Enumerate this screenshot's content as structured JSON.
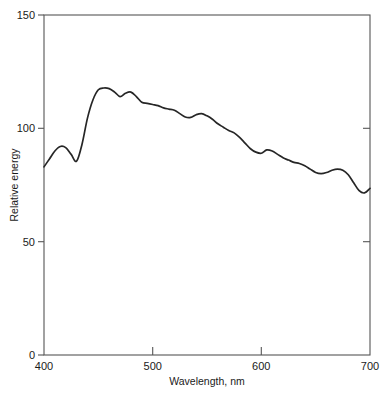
{
  "chart_data": {
    "type": "line",
    "title": "",
    "subtitle": "",
    "xlabel": "Wavelength, nm",
    "ylabel": "Relative energy",
    "xlim": [
      400,
      700
    ],
    "ylim": [
      0,
      150
    ],
    "xticks": [
      400,
      500,
      600,
      700
    ],
    "yticks": [
      0,
      50,
      100,
      150
    ],
    "xtick_labels": [
      "400",
      "500",
      "600",
      "700"
    ],
    "ytick_labels": [
      "0",
      "50",
      "100",
      "150"
    ],
    "grid": false,
    "legend": null,
    "legend_position": "none",
    "annotations": [],
    "series": [
      {
        "name": "Relative spectral power",
        "color": "#262626",
        "x": [
          400,
          405,
          410,
          415,
          420,
          425,
          430,
          435,
          440,
          445,
          450,
          455,
          460,
          465,
          470,
          475,
          480,
          485,
          490,
          495,
          500,
          505,
          510,
          515,
          520,
          525,
          530,
          535,
          540,
          545,
          550,
          555,
          560,
          565,
          570,
          575,
          580,
          585,
          590,
          595,
          600,
          605,
          610,
          615,
          620,
          625,
          630,
          635,
          640,
          645,
          650,
          655,
          660,
          665,
          670,
          675,
          680,
          685,
          690,
          695,
          700
        ],
        "values": [
          83.0,
          86.5,
          90.0,
          92.0,
          91.5,
          88.5,
          85.5,
          93.0,
          104.5,
          112.5,
          117.0,
          117.8,
          117.5,
          116.0,
          114.0,
          115.5,
          116.0,
          114.0,
          111.5,
          111.0,
          110.5,
          110.0,
          109.0,
          108.5,
          108.0,
          106.5,
          105.0,
          104.8,
          106.0,
          106.5,
          105.5,
          104.0,
          102.0,
          100.5,
          99.0,
          98.0,
          96.0,
          93.5,
          91.0,
          89.5,
          89.0,
          90.5,
          90.0,
          88.5,
          87.0,
          86.0,
          85.0,
          84.5,
          83.5,
          82.0,
          80.5,
          80.0,
          80.5,
          81.5,
          82.0,
          81.5,
          79.5,
          76.0,
          72.5,
          71.5,
          73.5
        ]
      }
    ]
  },
  "axes": {
    "y_axis_title": "Relative energy",
    "x_axis_title": "Wavelength, nm",
    "y_top_label": "150",
    "y_mid_label": "100",
    "y_low_label": "50",
    "y_zero_label": "0",
    "x_start_label": "400",
    "x_500_label": "500",
    "x_600_label": "600",
    "x_end_label": "700"
  },
  "colors": {
    "curve": "#262626",
    "axis": "#555555",
    "text": "#1a1a1a",
    "background": "#ffffff"
  }
}
